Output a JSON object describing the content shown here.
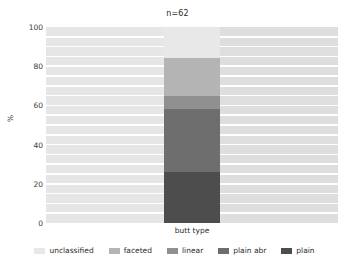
{
  "chart_data": {
    "type": "bar",
    "title": "n=62",
    "xlabel": "butt type",
    "ylabel": "%",
    "categories": [
      "butt type"
    ],
    "ylim": [
      0,
      100
    ],
    "yticks": [
      0,
      20,
      40,
      60,
      80,
      100
    ],
    "ytick_labels": [
      "0",
      "20",
      "40",
      "60",
      "80",
      "100"
    ],
    "grid": true,
    "grid_axis": "y",
    "legend_position": "bottom",
    "stacked": true,
    "stack_order_bottom_to_top": [
      "plain",
      "plain abr",
      "linear",
      "faceted",
      "unclassified"
    ],
    "series": [
      {
        "name": "unclassified",
        "values": [
          16.1
        ],
        "color": "#e8e8e8"
      },
      {
        "name": "faceted",
        "values": [
          19.4
        ],
        "color": "#b4b4b4"
      },
      {
        "name": "linear",
        "values": [
          6.5
        ],
        "color": "#909090"
      },
      {
        "name": "plain abr",
        "values": [
          32.3
        ],
        "color": "#6e6e6e"
      },
      {
        "name": "plain",
        "values": [
          25.8
        ],
        "color": "#4d4d4d"
      }
    ],
    "cumulative_tops": [
      25.8,
      58.1,
      64.5,
      83.9,
      100.0
    ],
    "counts_total": 62,
    "panel_background": "#e3e3e3",
    "gridline_color": "#ffffff"
  },
  "title": {
    "text": "n=62"
  },
  "axes": {
    "x": {
      "label": "butt type"
    },
    "y": {
      "label": "%",
      "ticks": [
        "100",
        "80",
        "60",
        "40",
        "20",
        "0"
      ]
    }
  },
  "legend": {
    "items": [
      {
        "label": "unclassified",
        "color": "#e8e8e8"
      },
      {
        "label": "faceted",
        "color": "#b4b4b4"
      },
      {
        "label": "linear",
        "color": "#909090"
      },
      {
        "label": "plain abr",
        "color": "#6e6e6e"
      },
      {
        "label": "plain",
        "color": "#4d4d4d"
      }
    ]
  }
}
